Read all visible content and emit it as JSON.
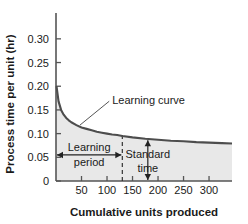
{
  "chart_data": {
    "type": "line",
    "title": "",
    "xlabel": "Cumulative units produced",
    "ylabel": "Process time per unit (hr)",
    "xlim": [
      0,
      345
    ],
    "ylim": [
      0,
      0.325
    ],
    "grid": false,
    "legend": "none",
    "xticks": [
      50,
      100,
      150,
      200,
      250,
      300
    ],
    "xtick_labels": [
      "50",
      "100",
      "150",
      "200",
      "250",
      "300"
    ],
    "yticks": [
      0,
      0.05,
      0.1,
      0.15,
      0.2,
      0.25,
      0.3
    ],
    "ytick_labels": [
      "0",
      "0.05",
      "0.10",
      "0.15",
      "0.20",
      "0.25",
      "0.30"
    ],
    "series": [
      {
        "name": "Learning curve",
        "x": [
          1,
          5,
          10,
          15,
          20,
          25,
          30,
          40,
          50,
          60,
          70,
          80,
          90,
          100,
          110,
          120,
          130,
          150,
          175,
          200,
          225,
          250,
          275,
          300,
          325,
          345
        ],
        "y": [
          0.2,
          0.168,
          0.15,
          0.14,
          0.133,
          0.128,
          0.124,
          0.118,
          0.113,
          0.11,
          0.107,
          0.104,
          0.102,
          0.1,
          0.098,
          0.097,
          0.095,
          0.092,
          0.089,
          0.087,
          0.085,
          0.084,
          0.082,
          0.081,
          0.08,
          0.079
        ]
      }
    ],
    "fill": {
      "enabled": true,
      "color": "#e8e8e8",
      "from": 0
    },
    "annotations": [
      {
        "name": "learning-curve",
        "label": "Learning curve",
        "kind": "callout",
        "text_x": 120,
        "text_y": 0.162,
        "point_x": 47,
        "point_y": 0.118
      },
      {
        "name": "learning-period",
        "label_line1": "Learning",
        "label_line2": "period",
        "kind": "horizontal-double-arrow",
        "x_start": 0,
        "x_end": 130,
        "y": 0.055
      },
      {
        "name": "standard-time",
        "label_line1": "Standard",
        "label_line2": "time",
        "kind": "vertical-double-arrow",
        "x": 180,
        "y_start": 0.0,
        "y_end": 0.088
      },
      {
        "name": "learning-period-divider",
        "kind": "dashed-vertical-line",
        "x": 130,
        "y_start": 0.0,
        "y_end": 0.098
      }
    ],
    "colors": {
      "curve": "#4d4d4d",
      "fill": "#e8e8e8",
      "axis": "#555555",
      "text": "#1a1a1a"
    }
  }
}
